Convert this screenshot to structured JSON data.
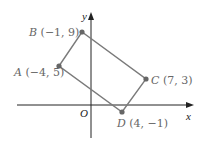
{
  "diagram": {
    "type": "coordinate-plane-rectangle",
    "axes": {
      "x_label": "x",
      "y_label": "y",
      "origin_label": "O"
    },
    "points": [
      {
        "name": "A",
        "coords": "(−4, 5)",
        "x": -4,
        "y": 5
      },
      {
        "name": "B",
        "coords": "(−1, 9)",
        "x": -1,
        "y": 9
      },
      {
        "name": "C",
        "coords": "(7, 3)",
        "x": 7,
        "y": 3
      },
      {
        "name": "D",
        "coords": "(4, −1)",
        "x": 4,
        "y": -1
      }
    ],
    "colors": {
      "axis": "#222222",
      "edge": "#7a7a7a",
      "vertex": "#666666",
      "label": "#666666"
    }
  }
}
